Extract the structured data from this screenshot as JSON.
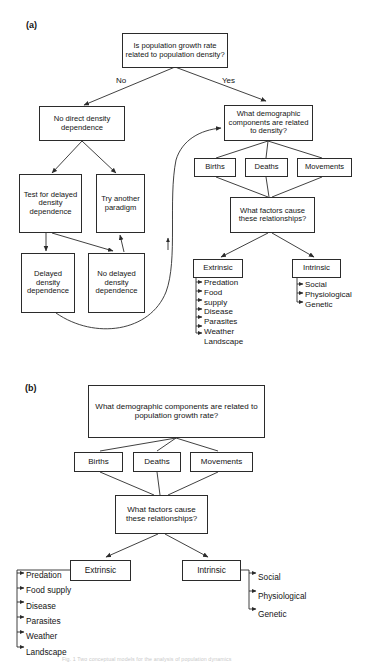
{
  "figure": {
    "panel_a": {
      "label": "(a)",
      "nodes": {
        "root": "Is population growth rate related to population density?",
        "no_branch": "No direct density dependence",
        "yes_branch": "What demographic components are related to density?",
        "test_delayed": "Test for delayed density dependence",
        "try_another": "Try another paradigm",
        "delayed_dd": "Delayed density dependence",
        "no_delayed_dd": "No delayed density dependence",
        "births": "Births",
        "deaths": "Deaths",
        "movements": "Movements",
        "what_factors": "What factors cause these relationships?",
        "extrinsic": "Extrinsic",
        "intrinsic": "Intrinsic"
      },
      "edge_labels": {
        "left": "No",
        "right": "Yes"
      },
      "extrinsic_list": [
        "Predation",
        "Food",
        "supply",
        "Disease",
        "Parasites",
        "Weather",
        "Landscape"
      ],
      "intrinsic_list": [
        "Social",
        "Physiological",
        "Genetic"
      ]
    },
    "panel_b": {
      "label": "(b)",
      "nodes": {
        "root": "What demographic components are related to population growth rate?",
        "births": "Births",
        "deaths": "Deaths",
        "movements": "Movements",
        "what_factors": "What factors cause these relationships?",
        "extrinsic": "Extrinsic",
        "intrinsic": "Intrinsic"
      },
      "extrinsic_list": [
        "Predation",
        "Food supply",
        "Disease",
        "Parasites",
        "Weather",
        "Landscape"
      ],
      "intrinsic_list": [
        "Social",
        "Physiological",
        "Genetic"
      ]
    },
    "caption": "Fig. 1 Two conceptual models for the analysis of population dynamics",
    "colors": {
      "stroke": "#2b2b2b",
      "text": "#141414",
      "background": "#ffffff"
    }
  }
}
